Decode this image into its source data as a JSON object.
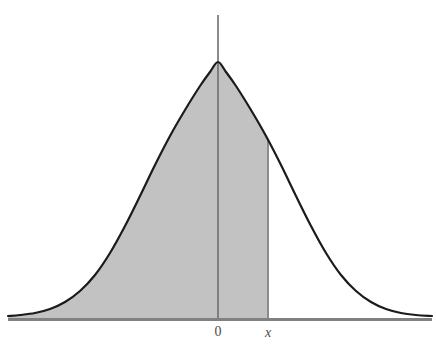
{
  "figure": {
    "name": "standard-normal-distribution-curve",
    "background_color": "#ffffff",
    "width": 436,
    "height": 349
  },
  "axis": {
    "horizontal": {
      "name": "x-axis",
      "color": "#808080",
      "thickness": 3,
      "y": 319,
      "x_start": 8,
      "x_end": 432
    },
    "vertical": {
      "name": "y-axis-at-mean",
      "color": "#6e6e6e",
      "thickness": 1.6,
      "x": 218,
      "y_top": 15,
      "y_bottom": 319
    }
  },
  "labels": {
    "zero": "0",
    "x": "x",
    "zero_color": "#4a4a4a",
    "x_color": "#4a4a4a"
  },
  "curve": {
    "stroke_color": "#1b1b1b",
    "stroke_width": 2.2,
    "fill_color": "#c2c2c2",
    "fill_stroke_color": "#8c8c8c"
  },
  "shaded_region": {
    "name": "cumulative-area-to-x",
    "right_boundary_x": 268,
    "fill_color": "#c2c2c2"
  },
  "chart_data": {
    "type": "area",
    "title": "",
    "subtitle": "",
    "xlabel": "",
    "ylabel": "",
    "legend": [],
    "grid": false,
    "distribution": "standard normal",
    "mean": 0,
    "std_dev": 1,
    "tick_labels": [
      "0",
      "x"
    ],
    "tick_positions_px": [
      218,
      268
    ],
    "shaded_upper_limit_label": "x",
    "shaded_description": "Area under the standard normal curve from negative infinity up to x",
    "peak_px": {
      "x": 218,
      "y": 62
    },
    "baseline_y_px": 319,
    "x_axis_px": [
      8,
      432
    ],
    "curve_points_px": [
      [
        8,
        316
      ],
      [
        20,
        315
      ],
      [
        35,
        313
      ],
      [
        50,
        309
      ],
      [
        65,
        302
      ],
      [
        80,
        291
      ],
      [
        95,
        275
      ],
      [
        110,
        253
      ],
      [
        125,
        226
      ],
      [
        140,
        196
      ],
      [
        155,
        165
      ],
      [
        170,
        136
      ],
      [
        185,
        110
      ],
      [
        200,
        86
      ],
      [
        210,
        72
      ],
      [
        218,
        62
      ],
      [
        226,
        72
      ],
      [
        236,
        86
      ],
      [
        251,
        110
      ],
      [
        266,
        136
      ],
      [
        281,
        165
      ],
      [
        296,
        196
      ],
      [
        311,
        226
      ],
      [
        326,
        253
      ],
      [
        341,
        275
      ],
      [
        356,
        291
      ],
      [
        371,
        302
      ],
      [
        386,
        309
      ],
      [
        401,
        313
      ],
      [
        416,
        315
      ],
      [
        432,
        316
      ]
    ]
  }
}
